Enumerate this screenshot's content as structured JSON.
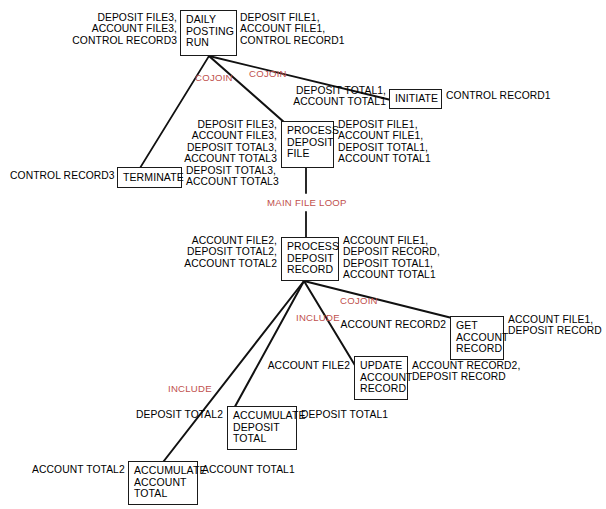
{
  "diagram": {
    "colors": {
      "node_border": "#1a1a1a",
      "edge": "#111111",
      "arc_label": "#c0504d",
      "text": "#000000",
      "background": "#ffffff"
    },
    "nodes": [
      {
        "id": "daily-posting-run",
        "lines": [
          "DAILY",
          "POSTING",
          "RUN"
        ]
      },
      {
        "id": "initiate",
        "lines": [
          "INITIATE"
        ]
      },
      {
        "id": "process-deposit-file",
        "lines": [
          "PROCESS",
          "DEPOSIT",
          "FILE"
        ]
      },
      {
        "id": "terminate",
        "lines": [
          "TERMINATE"
        ]
      },
      {
        "id": "process-deposit-record",
        "lines": [
          "PROCESS",
          "DEPOSIT",
          "RECORD"
        ]
      },
      {
        "id": "get-account-record",
        "lines": [
          "GET",
          "ACCOUNT",
          "RECORD"
        ]
      },
      {
        "id": "update-account-record",
        "lines": [
          "UPDATE",
          "ACCOUNT",
          "RECORD"
        ]
      },
      {
        "id": "accumulate-deposit-total",
        "lines": [
          "ACCUMULATE",
          "DEPOSIT",
          "TOTAL"
        ]
      },
      {
        "id": "accumulate-account-total",
        "lines": [
          "ACCUMULATE",
          "ACCOUNT",
          "TOTAL"
        ]
      }
    ],
    "data_labels": [
      {
        "id": "dpr-in",
        "text": "DEPOSIT FILE3,\nACCOUNT FILE3,\nCONTROL RECORD3"
      },
      {
        "id": "dpr-out",
        "text": "DEPOSIT FILE1,\nACCOUNT FILE1,\nCONTROL RECORD1"
      },
      {
        "id": "init-in",
        "text": "DEPOSIT TOTAL1,\nACCOUNT TOTAL1"
      },
      {
        "id": "init-out",
        "text": "CONTROL RECORD1"
      },
      {
        "id": "pdf-in",
        "text": "DEPOSIT FILE3,\nACCOUNT FILE3,\nDEPOSIT TOTAL3,\nACCOUNT TOTAL3"
      },
      {
        "id": "pdf-out",
        "text": "DEPOSIT FILE1,\nACCOUNT FILE1,\nDEPOSIT TOTAL1,\nACCOUNT TOTAL1"
      },
      {
        "id": "term-in",
        "text": "CONTROL RECORD3"
      },
      {
        "id": "term-out",
        "text": "DEPOSIT TOTAL3,\nACCOUNT TOTAL3"
      },
      {
        "id": "pdrec-in",
        "text": "ACCOUNT FILE2,\nDEPOSIT TOTAL2,\nACCOUNT TOTAL2"
      },
      {
        "id": "pdrec-out",
        "text": "ACCOUNT FILE1,\nDEPOSIT RECORD,\nDEPOSIT TOTAL1,\nACCOUNT TOTAL1"
      },
      {
        "id": "gar-in",
        "text": "ACCOUNT RECORD2"
      },
      {
        "id": "gar-out",
        "text": "ACCOUNT FILE1,\nDEPOSIT RECORD"
      },
      {
        "id": "uar-in",
        "text": "ACCOUNT FILE2"
      },
      {
        "id": "uar-out",
        "text": "ACCOUNT RECORD2,\nDEPOSIT RECORD"
      },
      {
        "id": "adt-in",
        "text": "DEPOSIT TOTAL2"
      },
      {
        "id": "adt-out",
        "text": "DEPOSIT TOTAL1"
      },
      {
        "id": "aat-in",
        "text": "ACCOUNT TOTAL2"
      },
      {
        "id": "aat-out",
        "text": "ACCOUNT TOTAL1"
      }
    ],
    "arc_labels": [
      {
        "id": "cojoin-1",
        "text": "COJOIN"
      },
      {
        "id": "cojoin-2",
        "text": "COJOIN"
      },
      {
        "id": "main-file-loop",
        "text": "MAIN FILE LOOP"
      },
      {
        "id": "cojoin-3",
        "text": "COJOIN"
      },
      {
        "id": "include-1",
        "text": "INCLUDE"
      },
      {
        "id": "include-2",
        "text": "INCLUDE"
      }
    ],
    "edges": [
      {
        "from": "daily-posting-run",
        "to": "terminate",
        "label": ""
      },
      {
        "from": "daily-posting-run",
        "to": "process-deposit-file",
        "label": "COJOIN"
      },
      {
        "from": "daily-posting-run",
        "to": "initiate",
        "label": "COJOIN"
      },
      {
        "from": "process-deposit-file",
        "to": "process-deposit-record",
        "label": "MAIN FILE LOOP"
      },
      {
        "from": "process-deposit-record",
        "to": "get-account-record",
        "label": "COJOIN"
      },
      {
        "from": "process-deposit-record",
        "to": "update-account-record",
        "label": "INCLUDE"
      },
      {
        "from": "process-deposit-record",
        "to": "accumulate-deposit-total",
        "label": "INCLUDE"
      },
      {
        "from": "process-deposit-record",
        "to": "accumulate-account-total",
        "label": ""
      }
    ]
  }
}
